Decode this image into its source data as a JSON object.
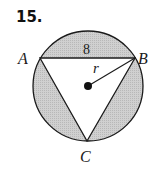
{
  "problem": {
    "number": "15."
  },
  "figure": {
    "shape": "circle with inscribed equilateral triangle",
    "shaded_region": "circle minus triangle",
    "colors": {
      "shade": "#c8c8c8",
      "stroke": "#1a1a1a",
      "background": "#ffffff"
    },
    "vertices": {
      "A": "A",
      "B": "B",
      "C": "C"
    },
    "side_label": "8",
    "radius_label": "r"
  }
}
